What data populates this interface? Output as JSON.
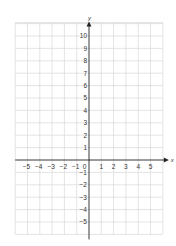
{
  "chart_data": {
    "type": "scatter",
    "title": "",
    "xlabel": "x",
    "ylabel": "y",
    "xlim": [
      -6,
      6
    ],
    "ylim": [
      -6,
      11
    ],
    "grid": true,
    "x_ticks": [
      -5,
      -4,
      -3,
      -2,
      -1,
      0,
      1,
      2,
      3,
      4,
      5
    ],
    "y_ticks": [
      10,
      9,
      8,
      7,
      6,
      5,
      4,
      3,
      2,
      1,
      -1,
      -2,
      -3,
      -4,
      -5
    ],
    "x_tick_labels": [
      "−5",
      "−4",
      "−3",
      "−2",
      "−1",
      "0",
      "1",
      "2",
      "3",
      "4",
      "5"
    ],
    "y_tick_labels": [
      "10",
      "9",
      "8",
      "7",
      "6",
      "5",
      "4",
      "3",
      "2",
      "1",
      "−1",
      "−2",
      "−3",
      "−4",
      "−5"
    ],
    "series": [],
    "points": []
  },
  "colors": {
    "grid": "#d9d9d9",
    "axis": "#222222",
    "text": "#333333",
    "background": "#ffffff"
  }
}
